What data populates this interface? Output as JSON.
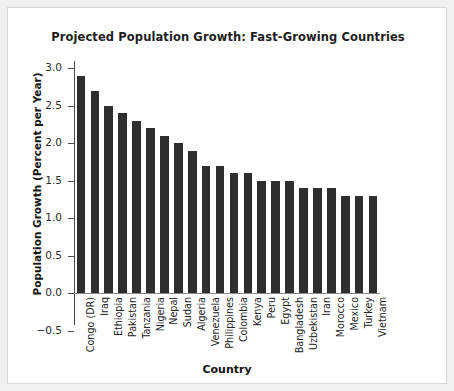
{
  "chart_data": {
    "type": "bar",
    "title": "Projected Population Growth: Fast-Growing Countries",
    "xlabel": "Country",
    "ylabel": "Population Growth (Percent per Year)",
    "ylim": [
      -0.5,
      3.0
    ],
    "ytick_labels": [
      "3.0",
      "2.5",
      "2.0",
      "1.5",
      "1.0",
      "0.5",
      "0.0",
      "−0.5"
    ],
    "ytick_values": [
      3.0,
      2.5,
      2.0,
      1.5,
      1.0,
      0.5,
      0.0,
      -0.5
    ],
    "grid": false,
    "legend": "none",
    "bar_color": "#2e2e2e",
    "categories": [
      "Congo (DR)",
      "Iraq",
      "Ethiopia",
      "Pakistan",
      "Tanzania",
      "Nigeria",
      "Nepal",
      "Sudan",
      "Algeria",
      "Venezuela",
      "Philippines",
      "Colombia",
      "Kenya",
      "Peru",
      "Egypt",
      "Bangladesh",
      "Uzbekistan",
      "Iran",
      "Morocco",
      "Mexico",
      "Turkey",
      "Vietnam"
    ],
    "values": [
      2.9,
      2.7,
      2.5,
      2.4,
      2.3,
      2.2,
      2.1,
      2.0,
      1.9,
      1.7,
      1.7,
      1.6,
      1.6,
      1.5,
      1.5,
      1.5,
      1.4,
      1.4,
      1.4,
      1.3,
      1.3,
      1.3
    ]
  }
}
